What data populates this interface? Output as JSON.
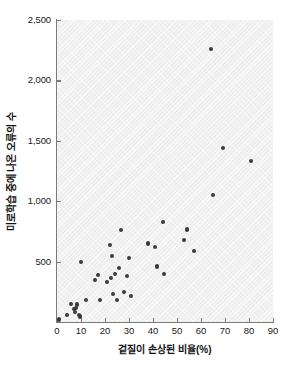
{
  "chart_data": {
    "type": "scatter",
    "title": "",
    "xlabel": "겉질이 손상된 비율(%)",
    "ylabel": "미로학습 중에 나온 오류의 수",
    "xlim": [
      0,
      90
    ],
    "ylim": [
      0,
      2500
    ],
    "xticks": [
      0,
      10,
      20,
      30,
      40,
      50,
      60,
      70,
      80,
      90
    ],
    "xtick_labels": [
      "0",
      "10",
      "20",
      "30",
      "40",
      "50",
      "60",
      "70",
      "80",
      "90"
    ],
    "yticks": [
      500,
      1000,
      1500,
      2000,
      2500
    ],
    "ytick_labels": [
      "500",
      "1,000",
      "1,500",
      "2,000",
      "2,500"
    ],
    "grid": false,
    "legend": null,
    "marker_color": "#3a3a3a",
    "plot_background": "#eeeeee",
    "points": [
      {
        "x": 1,
        "y": 20
      },
      {
        "x": 4,
        "y": 55
      },
      {
        "x": 6,
        "y": 150
      },
      {
        "x": 7,
        "y": 105
      },
      {
        "x": 7.5,
        "y": 80
      },
      {
        "x": 8,
        "y": 115
      },
      {
        "x": 8.5,
        "y": 145
      },
      {
        "x": 9,
        "y": 60
      },
      {
        "x": 9.5,
        "y": 45
      },
      {
        "x": 10,
        "y": 500
      },
      {
        "x": 12,
        "y": 185
      },
      {
        "x": 16,
        "y": 350
      },
      {
        "x": 17,
        "y": 390
      },
      {
        "x": 18,
        "y": 185
      },
      {
        "x": 21,
        "y": 330
      },
      {
        "x": 22,
        "y": 640
      },
      {
        "x": 22.5,
        "y": 365
      },
      {
        "x": 23,
        "y": 545
      },
      {
        "x": 23.5,
        "y": 230
      },
      {
        "x": 24,
        "y": 395
      },
      {
        "x": 25,
        "y": 180
      },
      {
        "x": 26,
        "y": 450
      },
      {
        "x": 26.5,
        "y": 760
      },
      {
        "x": 28,
        "y": 250
      },
      {
        "x": 29,
        "y": 380
      },
      {
        "x": 30,
        "y": 530
      },
      {
        "x": 31,
        "y": 215
      },
      {
        "x": 38,
        "y": 650
      },
      {
        "x": 41,
        "y": 620
      },
      {
        "x": 41.5,
        "y": 460
      },
      {
        "x": 44,
        "y": 825
      },
      {
        "x": 44.5,
        "y": 395
      },
      {
        "x": 53,
        "y": 680
      },
      {
        "x": 54,
        "y": 765
      },
      {
        "x": 57,
        "y": 590
      },
      {
        "x": 64,
        "y": 2260
      },
      {
        "x": 65,
        "y": 1050
      },
      {
        "x": 69,
        "y": 1440
      },
      {
        "x": 81,
        "y": 1330
      }
    ]
  }
}
